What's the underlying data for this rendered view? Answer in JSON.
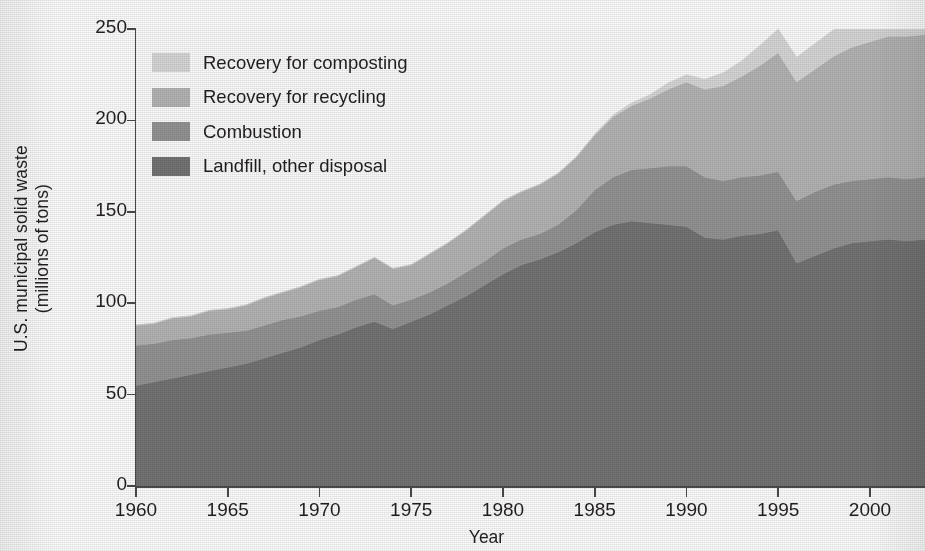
{
  "chart_data": {
    "type": "area",
    "stacked": true,
    "title": "",
    "xlabel": "Year",
    "ylabel": "U.S. municipal solid waste (millions of tons)",
    "ylabel_line1": "U.S. municipal solid waste",
    "ylabel_line2": "(millions of tons)",
    "xlim": [
      1960,
      2003
    ],
    "ylim": [
      0,
      250
    ],
    "ytick_labels": [
      "0",
      "50",
      "100",
      "150",
      "200",
      "250"
    ],
    "ytick_values": [
      0,
      50,
      100,
      150,
      200,
      250
    ],
    "xtick_labels": [
      "1960",
      "1965",
      "1970",
      "1975",
      "1980",
      "1985",
      "1990",
      "1995",
      "2000"
    ],
    "xtick_values": [
      1960,
      1965,
      1970,
      1975,
      1980,
      1985,
      1990,
      1995,
      2000
    ],
    "grid": false,
    "legend_position": "upper-left",
    "x": [
      1960,
      1961,
      1962,
      1963,
      1964,
      1965,
      1966,
      1967,
      1968,
      1969,
      1970,
      1971,
      1972,
      1973,
      1974,
      1975,
      1976,
      1977,
      1978,
      1979,
      1980,
      1981,
      1982,
      1983,
      1984,
      1985,
      1986,
      1987,
      1988,
      1989,
      1990,
      1991,
      1992,
      1993,
      1994,
      1995,
      1996,
      1997,
      1998,
      1999,
      2000,
      2001,
      2002,
      2003
    ],
    "series": [
      {
        "name": "Landfill, other disposal",
        "color": "#747474",
        "values": [
          55,
          57,
          59,
          61,
          63,
          65,
          67,
          70,
          73,
          76,
          80,
          83,
          87,
          90,
          86,
          90,
          94,
          99,
          104,
          110,
          116,
          121,
          124,
          128,
          133,
          139,
          143,
          145,
          144,
          143,
          142,
          136,
          135,
          137,
          138,
          140,
          122,
          126,
          130,
          133,
          134,
          135,
          134,
          135
        ]
      },
      {
        "name": "Combustion",
        "color": "#949494",
        "values": [
          22,
          21,
          21,
          20,
          20,
          19,
          18,
          18,
          18,
          17,
          16,
          15,
          15,
          15,
          13,
          12,
          12,
          12,
          13,
          13,
          14,
          14,
          14,
          15,
          18,
          23,
          26,
          28,
          30,
          32,
          33,
          33,
          32,
          32,
          32,
          32,
          34,
          35,
          35,
          34,
          34,
          34,
          34,
          34
        ]
      },
      {
        "name": "Recovery for recycling",
        "color": "#b5b5b5",
        "values": [
          11,
          11,
          12,
          12,
          13,
          13,
          14,
          15,
          15,
          16,
          17,
          17,
          18,
          20,
          20,
          19,
          21,
          22,
          23,
          25,
          26,
          26,
          27,
          28,
          29,
          30,
          33,
          35,
          38,
          42,
          46,
          48,
          52,
          55,
          60,
          65,
          65,
          67,
          70,
          73,
          75,
          77,
          78,
          78
        ]
      },
      {
        "name": "Recovery for composting",
        "color": "#d8d8d8",
        "values": [
          0,
          0,
          0,
          0,
          0,
          0,
          0,
          0,
          0,
          0,
          0,
          0,
          0,
          0,
          0,
          0,
          0,
          0,
          0,
          0,
          0,
          0,
          0,
          0,
          0,
          0.5,
          1,
          1.5,
          2,
          3.5,
          4,
          5.5,
          7,
          8.5,
          11,
          13,
          13.5,
          14,
          14.5,
          15,
          15.5,
          15.8,
          16,
          16
        ]
      }
    ]
  },
  "legend": {
    "items": [
      {
        "label": "Recovery for composting",
        "color": "#d8d8d8"
      },
      {
        "label": "Recovery for recycling",
        "color": "#b5b5b5"
      },
      {
        "label": "Combustion",
        "color": "#949494"
      },
      {
        "label": "Landfill, other disposal",
        "color": "#747474"
      }
    ]
  }
}
